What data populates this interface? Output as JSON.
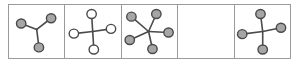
{
  "figure": {
    "panel_count": 5,
    "frame_color": "#9a9a9a",
    "background_color": "#ffffff",
    "edge_color": "#4a4a4a",
    "node_fill_color": "#a6a6a6",
    "node_open_color": "#ffffff",
    "node_stroke_color": "#4a4a4a",
    "panels": [
      {
        "index": 1,
        "name": "panel-three-node-star",
        "description": "Three filled nodes joined to a central hub",
        "node_count": 3,
        "node_style": "filled",
        "empty": false,
        "hub": {
          "x": 50,
          "y": 46
        },
        "nodes": [
          {
            "x": 22,
            "y": 35,
            "label": "node-1"
          },
          {
            "x": 76,
            "y": 25,
            "label": "node-2"
          },
          {
            "x": 54,
            "y": 80,
            "label": "node-3"
          }
        ]
      },
      {
        "index": 2,
        "name": "panel-four-node-open-cross",
        "description": "Four hollow nodes in a cross arrangement",
        "node_count": 4,
        "node_style": "open",
        "empty": false,
        "hub": {
          "x": 50,
          "y": 50
        },
        "nodes": [
          {
            "x": 48,
            "y": 17,
            "label": "node-1"
          },
          {
            "x": 83,
            "y": 45,
            "label": "node-2"
          },
          {
            "x": 52,
            "y": 84,
            "label": "node-3"
          },
          {
            "x": 16,
            "y": 54,
            "label": "node-4"
          }
        ]
      },
      {
        "index": 3,
        "name": "panel-five-node-star",
        "description": "Five filled nodes radiating from a central hub",
        "node_count": 5,
        "node_style": "filled",
        "empty": false,
        "hub": {
          "x": 48,
          "y": 50
        },
        "nodes": [
          {
            "x": 17,
            "y": 22,
            "label": "node-1"
          },
          {
            "x": 62,
            "y": 17,
            "label": "node-2"
          },
          {
            "x": 84,
            "y": 52,
            "label": "node-3"
          },
          {
            "x": 55,
            "y": 83,
            "label": "node-4"
          },
          {
            "x": 14,
            "y": 66,
            "label": "node-5"
          }
        ]
      },
      {
        "index": 4,
        "name": "panel-empty",
        "description": "Empty panel with no nodes or edges",
        "node_count": 0,
        "node_style": "none",
        "empty": true,
        "hub": null,
        "nodes": []
      },
      {
        "index": 5,
        "name": "panel-four-node-filled-cross",
        "description": "Four filled nodes in a cross arrangement",
        "node_count": 4,
        "node_style": "filled",
        "empty": false,
        "hub": {
          "x": 50,
          "y": 50
        },
        "nodes": [
          {
            "x": 46,
            "y": 17,
            "label": "node-1"
          },
          {
            "x": 83,
            "y": 43,
            "label": "node-2"
          },
          {
            "x": 50,
            "y": 84,
            "label": "node-3"
          },
          {
            "x": 13,
            "y": 55,
            "label": "node-4"
          }
        ]
      }
    ]
  }
}
